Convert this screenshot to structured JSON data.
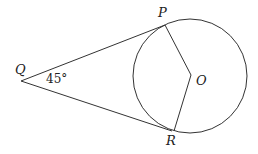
{
  "diagram": {
    "labels": {
      "P": "P",
      "Q": "Q",
      "R": "R",
      "O": "O"
    },
    "angle_label": "45°",
    "stroke_color": "#333333",
    "background": "#ffffff"
  }
}
